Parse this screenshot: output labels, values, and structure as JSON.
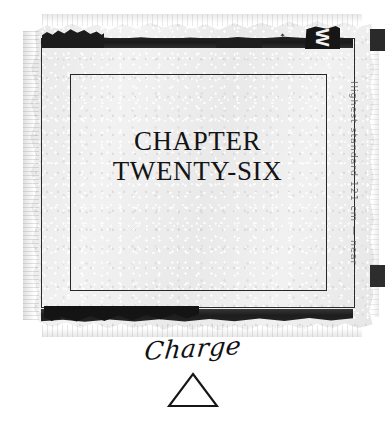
{
  "page": {
    "background_color": "#ffffff",
    "paper_color": "#ededed",
    "ink_color": "#141414"
  },
  "sheet": {
    "name": "torn-paper-scan",
    "marks": {
      "top_glyph": "W",
      "top_arrow": "←"
    },
    "margin_note": "Highest standard 121 cm — near"
  },
  "chapter": {
    "line1": "CHAPTER",
    "line2": "TWENTY-SIX"
  },
  "caption": {
    "word": "Charge",
    "symbol_name": "triangle-outline"
  }
}
